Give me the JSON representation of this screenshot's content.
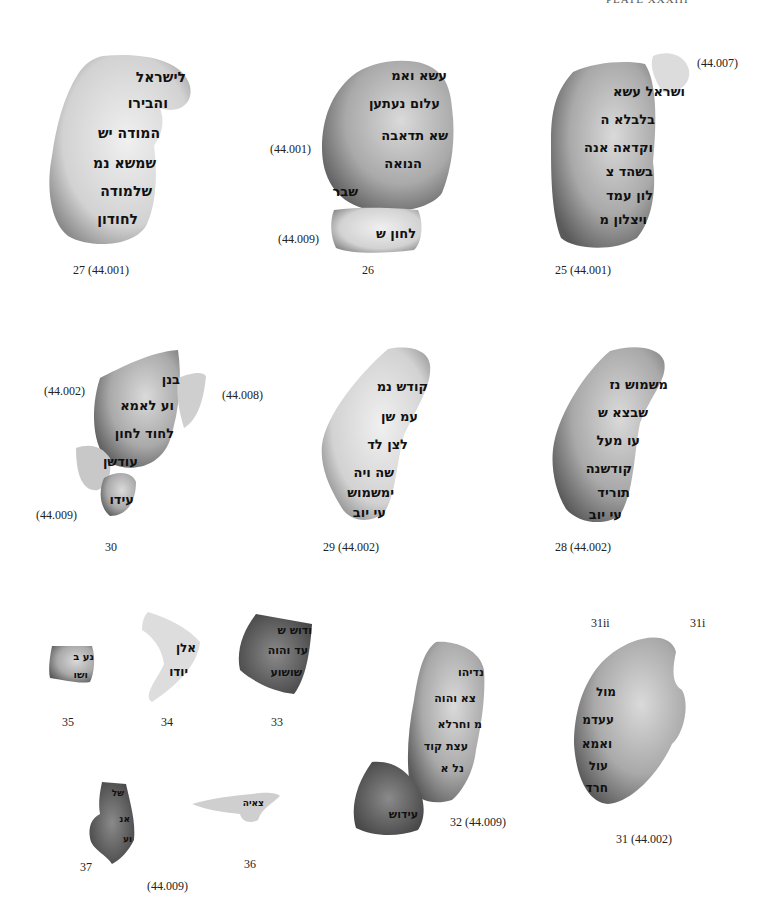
{
  "header": "PLATE XXXIII",
  "fragments": [
    {
      "id": "27",
      "label": "27 (44.001)",
      "lines": [
        "לישראל",
        "והבירו",
        "המודה יש",
        "שמשא נמ",
        "שלמודה",
        "לחודון"
      ]
    },
    {
      "id": "26",
      "label": "26",
      "sub_labels": [
        "(44.001)",
        "(44.009)"
      ],
      "lines": [
        "עשא ואמ",
        "עלום נעתען",
        "שא תדאבה",
        "הנואה",
        "שבר",
        "לחון ש"
      ]
    },
    {
      "id": "25",
      "label": "25 (44.001)",
      "sub_labels": [
        "(44.007)"
      ],
      "lines": [
        "ושראל עשא",
        "בלבלא ה",
        "וקדאה אנה",
        "בשהד צ",
        "לון עמד",
        "ויצלון מ"
      ]
    },
    {
      "id": "30",
      "label": "30",
      "sub_labels": [
        "(44.002)",
        "(44.008)",
        "(44.009)"
      ],
      "lines": [
        "בנן",
        "וע לאמא",
        "לחוד לחון",
        "עודשן",
        "עידו"
      ]
    },
    {
      "id": "29",
      "label": "29 (44.002)",
      "lines": [
        "קודש נמ",
        "עמ שן",
        "לצן לד",
        "שה ויה",
        "ימשמוש",
        "עי יוב"
      ]
    },
    {
      "id": "28",
      "label": "28 (44.002)",
      "lines": [
        "משמוש נז",
        "שבצא ש",
        "עו מעל",
        "קודשנה",
        "תוריד",
        "עי יוב"
      ]
    },
    {
      "id": "35",
      "label": "35",
      "lines": [
        "נע ב",
        "ושו"
      ]
    },
    {
      "id": "34",
      "label": "34",
      "lines": [
        "אלן",
        "יודו"
      ]
    },
    {
      "id": "33",
      "label": "33",
      "lines": [
        "ודוש ש",
        "עד והוה",
        "שושוע"
      ]
    },
    {
      "id": "32",
      "label": "32 (44.009)",
      "lines": [
        "נדיהו",
        "צא והוה",
        "מ וחרלא",
        "עצת קוד",
        "נל א",
        "עידוש"
      ]
    },
    {
      "id": "31",
      "label": "31 (44.002)",
      "sub_labels": [
        "31ii",
        "31i"
      ],
      "lines": [
        "מול",
        "עעדמ",
        "ואמא",
        "עול",
        "חרד"
      ]
    },
    {
      "id": "37",
      "label": "37",
      "lines": [
        "של",
        "אנ",
        "וע"
      ]
    },
    {
      "id": "36",
      "label": "36",
      "sub_labels": [
        "(44.009)"
      ],
      "lines": [
        "צאיה"
      ]
    }
  ],
  "colors": {
    "parchment_light": "#e6e6e6",
    "parchment_mid": "#b8b8b8",
    "parchment_dark": "#6e6e6e",
    "ink": "#111111",
    "label": "#222222"
  }
}
